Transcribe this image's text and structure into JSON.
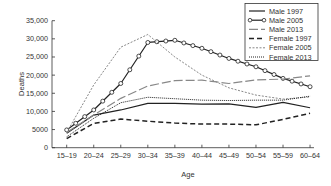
{
  "chart_data": {
    "type": "line",
    "title": "",
    "xlabel": "Age",
    "ylabel": "Deaths",
    "ylim": [
      0,
      35000
    ],
    "yticks": [
      0,
      5000,
      10000,
      15000,
      20000,
      25000,
      30000,
      35000
    ],
    "ytick_labels": [
      "0",
      "5000",
      "10,000",
      "15,000",
      "20,000",
      "25,000",
      "30,000",
      "35,000"
    ],
    "grid": false,
    "legend_position": "upper right",
    "categories": [
      "15–19",
      "20–24",
      "25–29",
      "30–34",
      "35–39",
      "40–44",
      "45–49",
      "50–54",
      "55–59",
      "60–64"
    ],
    "series": [
      {
        "name": "Male 1997",
        "style": "solid",
        "values": [
          4000,
          9000,
          10400,
          12200,
          12200,
          12000,
          12100,
          11100,
          12500,
          11000
        ]
      },
      {
        "name": "Male 2005",
        "style": "solid-circles",
        "values": [
          4900,
          10400,
          17700,
          29000,
          29600,
          27400,
          24600,
          22300,
          19100,
          16800
        ]
      },
      {
        "name": "Male 2013",
        "style": "long-dash",
        "values": [
          4200,
          9000,
          13600,
          17000,
          18500,
          18600,
          17700,
          18700,
          18900,
          19800
        ]
      },
      {
        "name": "Female 1997",
        "style": "dash",
        "values": [
          2500,
          6700,
          7900,
          7300,
          6800,
          6500,
          6500,
          6300,
          7800,
          9500
        ]
      },
      {
        "name": "Female 2005",
        "style": "short-dash",
        "values": [
          4200,
          17300,
          27700,
          31200,
          25000,
          20000,
          16500,
          14500,
          13400,
          14000
        ]
      },
      {
        "name": "Female 2013",
        "style": "dotted",
        "values": [
          3000,
          8100,
          12400,
          13900,
          13500,
          13100,
          13000,
          13100,
          13100,
          14200
        ]
      }
    ]
  },
  "legend": {
    "items": [
      "Male 1997",
      "Male 2005",
      "Male 2013",
      "Female 1997",
      "Female 2005",
      "Female 2013"
    ]
  },
  "axes": {
    "xlabel": "Age",
    "ylabel": "Deaths"
  }
}
